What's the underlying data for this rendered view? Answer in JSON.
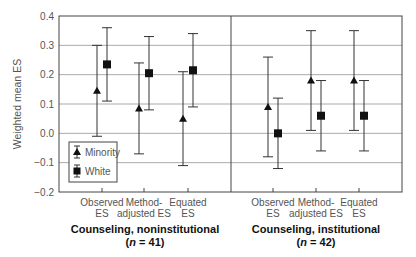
{
  "chart_data": {
    "type": "scatter",
    "subtype": "errorbar",
    "ylabel": "Weighted mean ES",
    "ylim": [
      -0.2,
      0.4
    ],
    "yticks": [
      -0.2,
      -0.1,
      0.0,
      0.1,
      0.2,
      0.3,
      0.4
    ],
    "ytick_labels": [
      "−0.2",
      "−0.1",
      "0.0",
      "0.1",
      "0.2",
      "0.3",
      "0.4"
    ],
    "grid": "horizontal",
    "legend": {
      "position": "lower-left of left panel",
      "entries": [
        {
          "name": "Minority",
          "marker": "triangle"
        },
        {
          "name": "White",
          "marker": "square"
        }
      ]
    },
    "categories": [
      [
        "Observed",
        "ES"
      ],
      [
        "Method-",
        "adjusted ES"
      ],
      [
        "Equated",
        "ES"
      ]
    ],
    "panels": [
      {
        "title": "Counseling, noninstitutional",
        "n_label": "(n = 41)",
        "n": 41,
        "series": [
          {
            "name": "Minority",
            "points": [
              {
                "category": "Observed ES",
                "mean": 0.145,
                "low": -0.01,
                "high": 0.3
              },
              {
                "category": "Method-adjusted ES",
                "mean": 0.085,
                "low": -0.07,
                "high": 0.24
              },
              {
                "category": "Equated ES",
                "mean": 0.05,
                "low": -0.11,
                "high": 0.21
              }
            ]
          },
          {
            "name": "White",
            "points": [
              {
                "category": "Observed ES",
                "mean": 0.235,
                "low": 0.11,
                "high": 0.36
              },
              {
                "category": "Method-adjusted ES",
                "mean": 0.205,
                "low": 0.08,
                "high": 0.33
              },
              {
                "category": "Equated ES",
                "mean": 0.215,
                "low": 0.09,
                "high": 0.34
              }
            ]
          }
        ]
      },
      {
        "title": "Counseling, institutional",
        "n_label": "(n = 42)",
        "n": 42,
        "series": [
          {
            "name": "Minority",
            "points": [
              {
                "category": "Observed ES",
                "mean": 0.09,
                "low": -0.08,
                "high": 0.26
              },
              {
                "category": "Method-adjusted ES",
                "mean": 0.18,
                "low": 0.01,
                "high": 0.35
              },
              {
                "category": "Equated ES",
                "mean": 0.18,
                "low": 0.01,
                "high": 0.35
              }
            ]
          },
          {
            "name": "White",
            "points": [
              {
                "category": "Observed ES",
                "mean": 0.0,
                "low": -0.12,
                "high": 0.12
              },
              {
                "category": "Method-adjusted ES",
                "mean": 0.06,
                "low": -0.06,
                "high": 0.18
              },
              {
                "category": "Equated ES",
                "mean": 0.06,
                "low": -0.06,
                "high": 0.18
              }
            ]
          }
        ]
      }
    ]
  },
  "colors": {
    "axis": "#444444",
    "grid": "#aaaaaa",
    "marker": "#111111",
    "errorbar": "#333333",
    "text": "#555555"
  }
}
